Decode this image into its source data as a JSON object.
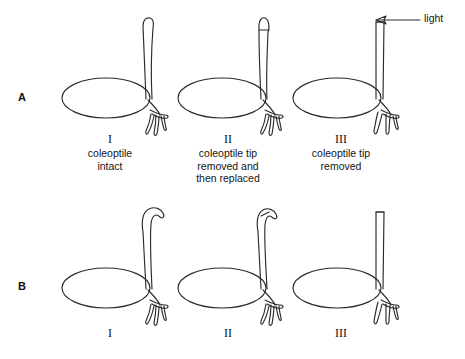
{
  "figure": {
    "rows": [
      {
        "id": "A",
        "label": "A",
        "description": "setup before illumination"
      },
      {
        "id": "B",
        "label": "B",
        "description": "result after illumination"
      }
    ],
    "light": {
      "label": "light",
      "direction": "arrow pointing left",
      "icon": "left-arrow-icon"
    },
    "columns": [
      {
        "numeral": "I",
        "caption": "coleoptile\nintact",
        "setup": {
          "tip": "intact-rounded-tip",
          "coleoptile": "upright"
        },
        "result": {
          "bend": "curves-toward-light"
        }
      },
      {
        "numeral": "II",
        "caption": "coleoptile tip\nremoved and\nthen replaced",
        "setup": {
          "tip": "tip-cut-and-replaced",
          "coleoptile": "upright"
        },
        "result": {
          "bend": "curves-toward-light"
        }
      },
      {
        "numeral": "III",
        "caption": "coleoptile tip\nremoved",
        "setup": {
          "tip": "flat-decapitated",
          "coleoptile": "upright"
        },
        "result": {
          "bend": "remains-straight"
        }
      }
    ],
    "colors": {
      "ink": "#2b2b2b",
      "text": "#141414",
      "background": "#ffffff"
    }
  }
}
